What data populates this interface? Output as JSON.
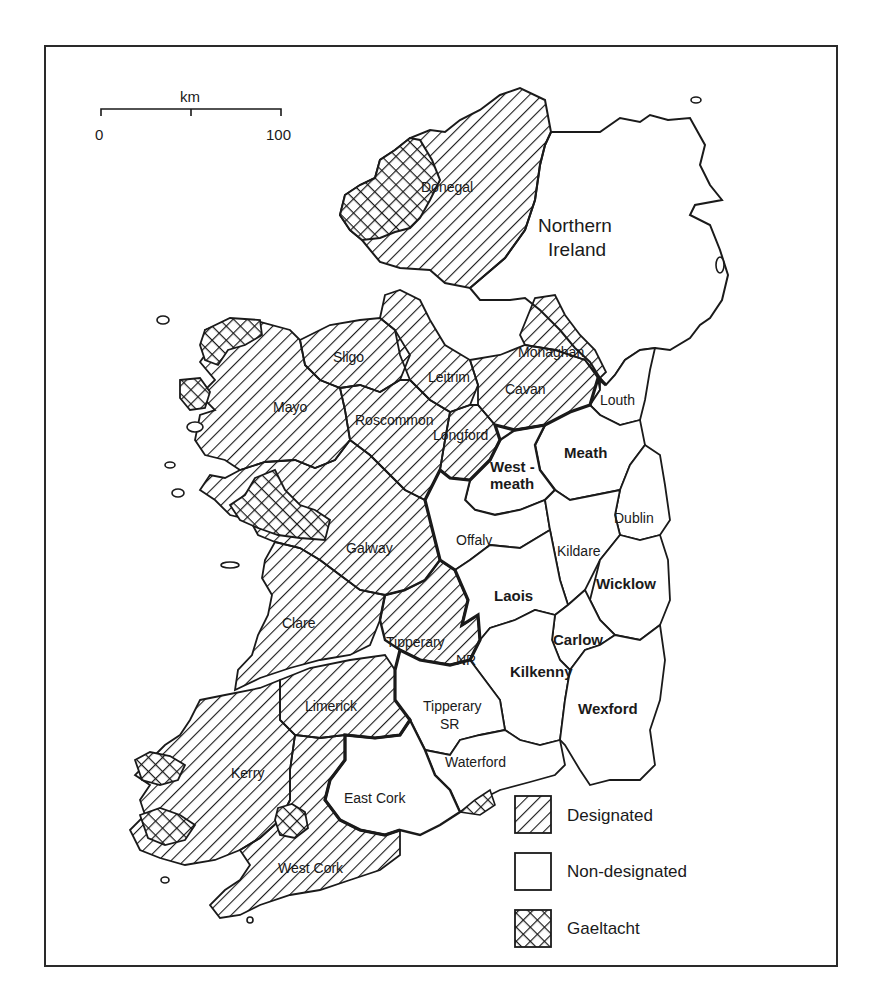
{
  "map": {
    "title": "",
    "scale_bar": {
      "unit": "km",
      "min_label": "0",
      "max_label": "100"
    },
    "region_labels": {
      "northern_ireland": [
        "Northern",
        "Ireland"
      ]
    },
    "counties": {
      "donegal": "Donegal",
      "sligo": "Sligo",
      "leitrim": "Leitrim",
      "cavan": "Cavan",
      "monaghan": "Monaghan",
      "louth": "Louth",
      "mayo": "Mayo",
      "roscommon": "Roscommon",
      "longford": "Longford",
      "westmeath_1": "West -",
      "westmeath_2": "meath",
      "meath": "Meath",
      "dublin": "Dublin",
      "galway": "Galway",
      "offaly": "Offaly",
      "kildare": "Kildare",
      "wicklow": "Wicklow",
      "laois": "Laois",
      "clare": "Clare",
      "tipperary_nr_1": "Tipperary",
      "tipperary_nr_2": "NR",
      "carlow": "Carlow",
      "kilkenny": "Kilkenny",
      "limerick": "Limerick",
      "tipperary_sr_1": "Tipperary",
      "tipperary_sr_2": "SR",
      "wexford": "Wexford",
      "kerry": "Kerry",
      "waterford": "Waterford",
      "east_cork": "East Cork",
      "west_cork": "West Cork"
    },
    "legend": {
      "items": [
        {
          "key": "designated",
          "label": "Designated",
          "pattern": "diagonal-hatch"
        },
        {
          "key": "non_designated",
          "label": "Non-designated",
          "pattern": "blank"
        },
        {
          "key": "gaeltacht",
          "label": "Gaeltacht",
          "pattern": "cross-hatch"
        }
      ]
    },
    "colors": {
      "ink": "#1a1a1a",
      "paper": "#ffffff"
    }
  }
}
